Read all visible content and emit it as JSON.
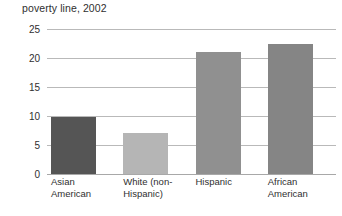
{
  "chart_data": {
    "type": "bar",
    "title": "poverty line, 2002",
    "xlabel": "",
    "ylabel": "",
    "ylim": [
      0,
      25
    ],
    "yticks": [
      0,
      5,
      10,
      15,
      20,
      25
    ],
    "ytick_labels": [
      "0",
      "5",
      "10",
      "15",
      "20",
      "25"
    ],
    "grid": true,
    "legend": "none",
    "categories": [
      "Asian\nAmerican",
      "White (non-\nHispanic)",
      "Hispanic",
      "African\nAmerican"
    ],
    "values": [
      9.8,
      7.0,
      21.0,
      22.5
    ],
    "colors": [
      "#555555",
      "#b5b5b5",
      "#909090",
      "#858585"
    ]
  },
  "axis": {
    "gridline_color": "#b9b9b9",
    "baseline_color": "#a8a8a8"
  }
}
